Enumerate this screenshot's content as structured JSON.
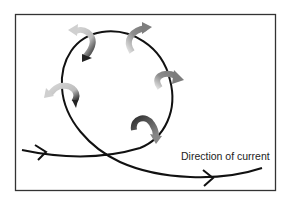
{
  "diagram": {
    "label": "Direction of current",
    "colors": {
      "frame": "#333333",
      "path": "#111111",
      "arrow_light": "#cfcfcf",
      "arrow_mid": "#8a8a8a",
      "arrow_dark": "#2a2a2a"
    },
    "rotating_arrows": [
      {
        "position": "top-left",
        "tone": "light-to-dark"
      },
      {
        "position": "top",
        "tone": "mid"
      },
      {
        "position": "right",
        "tone": "mid"
      },
      {
        "position": "left",
        "tone": "light-to-dark"
      },
      {
        "position": "bottom-right",
        "tone": "dark-to-mid"
      }
    ]
  }
}
